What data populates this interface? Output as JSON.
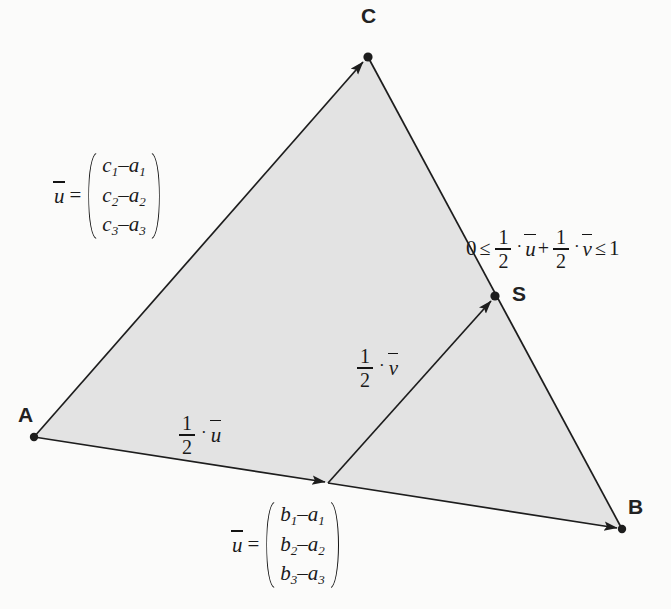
{
  "figure": {
    "type": "geometry-diagram",
    "background_color": "#fbfbfa",
    "fill_color": "#e3e3e3",
    "stroke_color": "#1d1d1d",
    "points": [
      {
        "name": "A",
        "label": "A",
        "x": 34,
        "y": 437,
        "label_x": 18,
        "label_y": 404
      },
      {
        "name": "B",
        "label": "B",
        "x": 622,
        "y": 529,
        "label_x": 628,
        "label_y": 496
      },
      {
        "name": "C",
        "label": "C",
        "x": 368,
        "y": 57,
        "label_x": 361,
        "label_y": 5
      },
      {
        "name": "S",
        "label": "S",
        "x": 495,
        "y": 296,
        "label_x": 512,
        "label_y": 283
      },
      {
        "name": "M",
        "label": "",
        "x": 328,
        "y": 483,
        "label_x": 0,
        "label_y": 0
      }
    ],
    "edges": [
      {
        "from": "A",
        "to": "C",
        "arrow": true
      },
      {
        "from": "A",
        "to": "B",
        "arrow": true
      },
      {
        "from": "C",
        "to": "B",
        "arrow": false
      },
      {
        "from": "M",
        "to": "S",
        "arrow": true
      }
    ],
    "vector_c": {
      "lhs_var": "u",
      "equals": "=",
      "rows": [
        {
          "first": "c",
          "first_sub": "1",
          "minus": "–",
          "second": "a",
          "second_sub": "1"
        },
        {
          "first": "c",
          "first_sub": "2",
          "minus": "–",
          "second": "a",
          "second_sub": "2"
        },
        {
          "first": "c",
          "first_sub": "3",
          "minus": "–",
          "second": "a",
          "second_sub": "3"
        }
      ],
      "x": 54,
      "y": 152
    },
    "vector_b": {
      "lhs_var": "u",
      "equals": "=",
      "rows": [
        {
          "first": "b",
          "first_sub": "1",
          "minus": "–",
          "second": "a",
          "second_sub": "1"
        },
        {
          "first": "b",
          "first_sub": "2",
          "minus": "–",
          "second": "a",
          "second_sub": "2"
        },
        {
          "first": "b",
          "first_sub": "3",
          "minus": "–",
          "second": "a",
          "second_sub": "3"
        }
      ],
      "x": 232,
      "y": 501
    },
    "label_half_u": {
      "numerator": "1",
      "denominator": "2",
      "dot": "·",
      "var": "u",
      "x": 177,
      "y": 412
    },
    "label_half_v": {
      "numerator": "1",
      "denominator": "2",
      "dot": "·",
      "var": "v",
      "x": 355,
      "y": 345
    },
    "inequality": {
      "zero": "0",
      "rel_left": "≤",
      "num1": "1",
      "den1": "2",
      "dot1": "·",
      "var1": "u",
      "plus": "+",
      "num2": "1",
      "den2": "2",
      "dot2": "·",
      "var2": "v",
      "rel_right": "≤",
      "one": "1",
      "x": 466,
      "y": 226
    }
  }
}
